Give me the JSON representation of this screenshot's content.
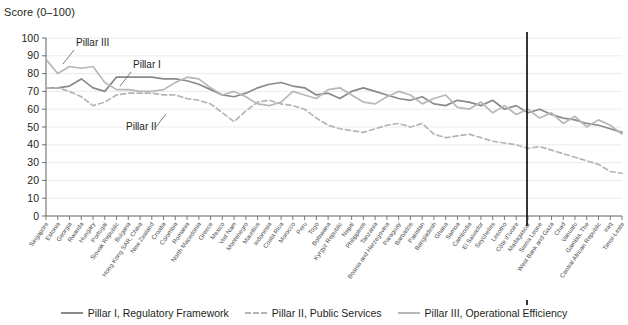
{
  "axis_title": "Score (0–100)",
  "annotations": [
    {
      "text": "Pillar III",
      "x": 76,
      "y": 46,
      "lx1": 74,
      "ly1": 50,
      "lx2": 63,
      "ly2": 64
    },
    {
      "text": "Pillar I",
      "x": 133,
      "y": 68,
      "lx1": 131,
      "ly1": 72,
      "lx2": 120,
      "ly2": 86
    },
    {
      "text": "Pillar II",
      "x": 126,
      "y": 130,
      "lx1": 156,
      "ly1": 127,
      "lx2": 166,
      "ly2": 114
    }
  ],
  "legend": [
    {
      "label": "Pillar I, Regulatory Framework",
      "style": "solid",
      "color": "#8a8a8a"
    },
    {
      "label": "Pillar II, Public Services",
      "style": "dashed",
      "color": "#b5b5b5"
    },
    {
      "label": "Pillar III, Operational Efficiency",
      "style": "solid",
      "color": "#b8b8b8"
    }
  ],
  "marker_line": {
    "index": 62,
    "color": "#231f20"
  },
  "chart_data": {
    "type": "line",
    "title": "",
    "xlabel": "",
    "ylabel": "Score (0–100)",
    "ylim": [
      0,
      100
    ],
    "ytick_step": 10,
    "yticks": [
      0,
      10,
      20,
      30,
      40,
      50,
      60,
      70,
      80,
      90,
      100
    ],
    "grid": true,
    "legend_position": "bottom",
    "categories": [
      "Singapore",
      "Estonia",
      "Georgia",
      "Rwanda",
      "Hungary",
      "Portugal",
      "Slovak Republic",
      "Bulgaria",
      "Hong Kong SAR, China",
      "New Zealand",
      "Croatia",
      "Colombia",
      "Romania",
      "North Macedonia",
      "Greece",
      "Mexico",
      "Viet Nam",
      "Montenegro",
      "Mauritius",
      "Indonesia",
      "Costa Rica",
      "Morocco",
      "Peru",
      "Togo",
      "Botswana",
      "Kyrgyz Republic",
      "Nepal",
      "Philippines",
      "Tanzania",
      "Bosnia and Herzegovina",
      "Paraguay",
      "Barbados",
      "Pakistan",
      "Bangladesh",
      "Ghana",
      "Samoa",
      "Cambodia",
      "El Salvador",
      "Seychelles",
      "Lesotho",
      "Côte d'Ivoire",
      "Madagascar",
      "Sierra Leone",
      "West Bank and Gaza",
      "Chad",
      "Vanuatu",
      "Gambia, The",
      "Central African Republic",
      "Iraq",
      "Timor-Leste"
    ],
    "series": [
      {
        "name": "Pillar I, Regulatory Framework",
        "color": "#8a8a8a",
        "style": "solid",
        "values": [
          72,
          72,
          73,
          77,
          72,
          70,
          78,
          78,
          78,
          78,
          77,
          77,
          76,
          74,
          71,
          68,
          67,
          69,
          72,
          74,
          75,
          73,
          72,
          68,
          69,
          66,
          70,
          72,
          70,
          68,
          66,
          65,
          67,
          63,
          62,
          65,
          64,
          62,
          65,
          60,
          62,
          58,
          60,
          57,
          55,
          54,
          52,
          51,
          49,
          47
        ]
      },
      {
        "name": "Pillar II, Public Services",
        "color": "#b5b5b5",
        "style": "dashed",
        "values": [
          72,
          72,
          70,
          67,
          62,
          64,
          68,
          69,
          69,
          69,
          68,
          68,
          66,
          65,
          63,
          58,
          53,
          59,
          64,
          65,
          63,
          62,
          60,
          55,
          51,
          49,
          48,
          47,
          49,
          51,
          52,
          50,
          52,
          46,
          44,
          45,
          46,
          44,
          42,
          41,
          40,
          38,
          39,
          37,
          35,
          33,
          31,
          29,
          25,
          24
        ]
      },
      {
        "name": "Pillar III, Operational Efficiency",
        "color": "#b8b8b8",
        "style": "solid",
        "values": [
          88,
          80,
          84,
          83,
          84,
          75,
          71,
          71,
          70,
          70,
          71,
          75,
          78,
          77,
          72,
          68,
          70,
          67,
          63,
          62,
          64,
          70,
          68,
          66,
          71,
          72,
          68,
          64,
          63,
          67,
          70,
          68,
          63,
          66,
          68,
          61,
          60,
          64,
          58,
          62,
          57,
          60,
          55,
          58,
          52,
          56,
          50,
          54,
          51,
          46
        ]
      }
    ]
  }
}
